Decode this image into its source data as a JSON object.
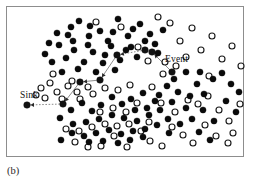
{
  "figure": {
    "caption": "(b)",
    "frame": {
      "x": 6,
      "y": 6,
      "width": 238,
      "height": 151,
      "border_color": "#8d8d8d"
    },
    "background_color": "#ffffff"
  },
  "labels": {
    "sink": "Sink",
    "event": "Event"
  },
  "chart_data": {
    "type": "scatter",
    "title": "",
    "subtitle": "",
    "xlabel": "",
    "ylabel": "",
    "xlim": [
      0,
      254
    ],
    "ylim": [
      0,
      183
    ],
    "grid": false,
    "legend_position": "none",
    "annotations": [
      {
        "text": "Sink",
        "x": 20,
        "y": 95
      },
      {
        "text": "Event",
        "x": 165,
        "y": 59
      },
      {
        "text": "(b)",
        "x": 7,
        "y": 170
      }
    ],
    "series": [
      {
        "name": "filled-nodes",
        "marker": "filled-circle",
        "color": "#0a0a0a",
        "radius": 3.1,
        "points": [
          [
            79,
            21
          ],
          [
            100,
            31
          ],
          [
            118,
            19
          ],
          [
            140,
            24
          ],
          [
            150,
            34
          ],
          [
            128,
            36
          ],
          [
            108,
            41
          ],
          [
            89,
            36
          ],
          [
            68,
            35
          ],
          [
            59,
            45
          ],
          [
            74,
            50
          ],
          [
            93,
            52
          ],
          [
            111,
            46
          ],
          [
            131,
            47
          ],
          [
            145,
            41
          ],
          [
            120,
            60
          ],
          [
            103,
            63
          ],
          [
            84,
            62
          ],
          [
            66,
            58
          ],
          [
            52,
            62
          ],
          [
            45,
            54
          ],
          [
            62,
            72
          ],
          [
            78,
            69
          ],
          [
            96,
            72
          ],
          [
            115,
            70
          ],
          [
            137,
            57
          ],
          [
            155,
            44
          ],
          [
            163,
            30
          ],
          [
            133,
            29
          ],
          [
            113,
            32
          ],
          [
            90,
            26
          ],
          [
            71,
            27
          ],
          [
            57,
            33
          ],
          [
            49,
            43
          ],
          [
            126,
            50
          ],
          [
            105,
            55
          ],
          [
            88,
            45
          ],
          [
            73,
            41
          ],
          [
            158,
            53
          ],
          [
            174,
            79
          ],
          [
            186,
            72
          ],
          [
            197,
            84
          ],
          [
            204,
            94
          ],
          [
            190,
            96
          ],
          [
            178,
            92
          ],
          [
            167,
            86
          ],
          [
            159,
            95
          ],
          [
            172,
            102
          ],
          [
            186,
            108
          ],
          [
            200,
            72
          ],
          [
            213,
            79
          ],
          [
            222,
            73
          ],
          [
            231,
            84
          ],
          [
            239,
            92
          ],
          [
            131,
            99
          ],
          [
            143,
            93
          ],
          [
            155,
            101
          ],
          [
            147,
            108
          ],
          [
            135,
            110
          ],
          [
            122,
            104
          ],
          [
            112,
            97
          ],
          [
            101,
            105
          ],
          [
            92,
            111
          ],
          [
            82,
            103
          ],
          [
            71,
            110
          ],
          [
            60,
            118
          ],
          [
            73,
            124
          ],
          [
            86,
            122
          ],
          [
            99,
            119
          ],
          [
            112,
            115
          ],
          [
            124,
            118
          ],
          [
            137,
            121
          ],
          [
            149,
            115
          ],
          [
            160,
            110
          ],
          [
            168,
            119
          ],
          [
            157,
            125
          ],
          [
            145,
            129
          ],
          [
            133,
            131
          ],
          [
            121,
            134
          ],
          [
            109,
            130
          ],
          [
            96,
            133
          ],
          [
            84,
            136
          ],
          [
            72,
            133
          ],
          [
            61,
            140
          ],
          [
            89,
            142
          ],
          [
            103,
            141
          ],
          [
            118,
            143
          ],
          [
            130,
            140
          ],
          [
            143,
            137
          ],
          [
            169,
            133
          ],
          [
            180,
            124
          ],
          [
            192,
            119
          ],
          [
            203,
            110
          ],
          [
            214,
            121
          ],
          [
            226,
            101
          ],
          [
            236,
            112
          ],
          [
            199,
            132
          ],
          [
            210,
            140
          ]
        ]
      },
      {
        "name": "open-nodes",
        "marker": "open-circle",
        "color": "#1a1a1a",
        "radius": 3.0,
        "points": [
          [
            96,
            22
          ],
          [
            138,
            47
          ],
          [
            121,
            27
          ],
          [
            148,
            61
          ],
          [
            158,
            17
          ],
          [
            170,
            23
          ],
          [
            180,
            41
          ],
          [
            192,
            28
          ],
          [
            201,
            50
          ],
          [
            212,
            36
          ],
          [
            222,
            59
          ],
          [
            232,
            46
          ],
          [
            241,
            66
          ],
          [
            186,
            57
          ],
          [
            165,
            62
          ],
          [
            176,
            66
          ],
          [
            41,
            88
          ],
          [
            50,
            83
          ],
          [
            57,
            92
          ],
          [
            68,
            86
          ],
          [
            45,
            98
          ],
          [
            36,
            95
          ],
          [
            62,
            99
          ],
          [
            77,
            92
          ],
          [
            88,
            87
          ],
          [
            53,
            74
          ],
          [
            72,
            81
          ],
          [
            80,
            99
          ],
          [
            93,
            94
          ],
          [
            105,
            88
          ],
          [
            118,
            90
          ],
          [
            130,
            85
          ],
          [
            152,
            87
          ],
          [
            163,
            74
          ],
          [
            175,
            112
          ],
          [
            188,
            100
          ],
          [
            198,
            104
          ],
          [
            208,
            96
          ],
          [
            219,
            110
          ],
          [
            229,
            121
          ],
          [
            240,
            104
          ],
          [
            100,
            112
          ],
          [
            113,
            108
          ],
          [
            126,
            112
          ],
          [
            137,
            103
          ],
          [
            149,
            122
          ],
          [
            161,
            103
          ],
          [
            172,
            127
          ],
          [
            183,
            135
          ],
          [
            193,
            143
          ],
          [
            205,
            125
          ],
          [
            216,
            136
          ],
          [
            228,
            143
          ],
          [
            66,
            129
          ],
          [
            79,
            131
          ],
          [
            92,
            127
          ],
          [
            105,
            124
          ],
          [
            117,
            126
          ],
          [
            129,
            124
          ],
          [
            141,
            131
          ],
          [
            75,
            142
          ],
          [
            88,
            147
          ],
          [
            101,
            146
          ],
          [
            114,
            136
          ],
          [
            127,
            147
          ],
          [
            150,
            141
          ],
          [
            162,
            146
          ],
          [
            209,
            76
          ],
          [
            233,
            133
          ]
        ]
      },
      {
        "name": "route-nodes",
        "marker": "filled-circle",
        "color": "#121212",
        "radius": 3.3,
        "points": [
          [
            27,
            105
          ],
          [
            63,
            104
          ],
          [
            80,
            82
          ],
          [
            100,
            80
          ],
          [
            117,
            55
          ],
          [
            145,
            50
          ],
          [
            152,
            52
          ],
          [
            172,
            72
          ]
        ]
      }
    ],
    "route": {
      "name": "event-to-sink-path",
      "color": "#6e6e6e",
      "nodes": [
        {
          "label": "Event",
          "x": 172,
          "y": 72
        },
        {
          "label": "",
          "x": 152,
          "y": 52
        },
        {
          "label": "",
          "x": 145,
          "y": 50
        },
        {
          "label": "",
          "x": 117,
          "y": 55
        },
        {
          "label": "",
          "x": 100,
          "y": 80
        },
        {
          "label": "",
          "x": 80,
          "y": 82
        },
        {
          "label": "",
          "x": 63,
          "y": 104
        },
        {
          "label": "Sink",
          "x": 27,
          "y": 105
        }
      ],
      "segments": [
        {
          "from": [
            172,
            72
          ],
          "to": [
            152,
            52
          ],
          "style": "solid",
          "arrow": true
        },
        {
          "from": [
            152,
            52
          ],
          "to": [
            145,
            50
          ],
          "style": "solid",
          "arrow": false
        },
        {
          "from": [
            145,
            50
          ],
          "to": [
            117,
            55
          ],
          "style": "dotted",
          "arrow": true
        },
        {
          "from": [
            117,
            55
          ],
          "to": [
            100,
            80
          ],
          "style": "solid",
          "arrow": true
        },
        {
          "from": [
            100,
            80
          ],
          "to": [
            80,
            82
          ],
          "style": "solid",
          "arrow": true
        },
        {
          "from": [
            80,
            82
          ],
          "to": [
            63,
            104
          ],
          "style": "solid",
          "arrow": true
        },
        {
          "from": [
            63,
            104
          ],
          "to": [
            27,
            105
          ],
          "style": "dotted",
          "arrow": true
        }
      ]
    }
  }
}
